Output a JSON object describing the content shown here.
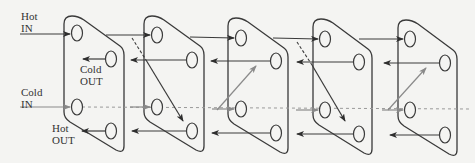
{
  "diagram": {
    "colors": {
      "hot": "#3a3a3a",
      "cold": "#8a8a8a",
      "background": "#f4f4f2"
    },
    "labels": {
      "hot_in": {
        "line1": "Hot",
        "line2": "IN"
      },
      "cold_out": {
        "line1": "Cold",
        "line2": "OUT"
      },
      "cold_in": {
        "line1": "Cold",
        "line2": "IN"
      },
      "hot_out": {
        "line1": "Hot",
        "line2": "OUT"
      }
    },
    "plates": [
      {
        "id": 1,
        "x": 64
      },
      {
        "id": 2,
        "x": 144
      },
      {
        "id": 3,
        "x": 228
      },
      {
        "id": 4,
        "x": 313
      },
      {
        "id": 5,
        "x": 398
      }
    ],
    "plate_count": 5,
    "ports_per_plate": 4
  }
}
